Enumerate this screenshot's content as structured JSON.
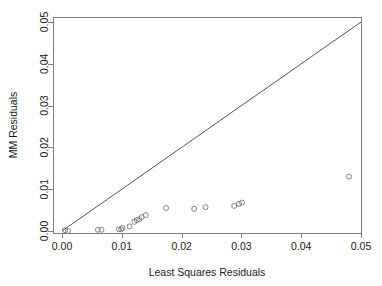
{
  "chart_data": {
    "type": "scatter",
    "title": "",
    "xlabel": "Least Squares Residuals",
    "ylabel": "MM Residuals",
    "xlim": [
      0.0,
      0.05
    ],
    "ylim": [
      0.0,
      0.05
    ],
    "xticks": [
      "0.00",
      "0.01",
      "0.02",
      "0.03",
      "0.04",
      "0.05"
    ],
    "xtick_values": [
      0.0,
      0.01,
      0.02,
      0.03,
      0.04,
      0.05
    ],
    "yticks": [
      "0.00",
      "0.01",
      "0.02",
      "0.03",
      "0.04",
      "0.05"
    ],
    "ytick_values": [
      0.0,
      0.01,
      0.02,
      0.03,
      0.04,
      0.05
    ],
    "grid": false,
    "legend": "none",
    "marker": "open-circle",
    "marker_color": "#777777",
    "series": [
      {
        "name": "residual-pairs",
        "points": [
          [
            0.0005,
            0.0002
          ],
          [
            0.001,
            0.0
          ],
          [
            0.006,
            0.0003
          ],
          [
            0.0066,
            0.0003
          ],
          [
            0.0095,
            0.0004
          ],
          [
            0.0099,
            0.0004
          ],
          [
            0.0101,
            0.0007
          ],
          [
            0.0113,
            0.0011
          ],
          [
            0.0121,
            0.0022
          ],
          [
            0.0125,
            0.0026
          ],
          [
            0.0129,
            0.0028
          ],
          [
            0.0133,
            0.0033
          ],
          [
            0.014,
            0.0038
          ],
          [
            0.0174,
            0.0055
          ],
          [
            0.0221,
            0.0053
          ],
          [
            0.024,
            0.0057
          ],
          [
            0.0288,
            0.006
          ],
          [
            0.0296,
            0.0065
          ],
          [
            0.0301,
            0.0068
          ],
          [
            0.048,
            0.013
          ]
        ]
      }
    ],
    "reference_line": {
      "name": "identity-line",
      "from": [
        0.0,
        0.0
      ],
      "to": [
        0.05,
        0.05
      ],
      "color": "#555555"
    }
  },
  "axes": {
    "x_title": "Least Squares Residuals",
    "y_title": "MM Residuals"
  }
}
